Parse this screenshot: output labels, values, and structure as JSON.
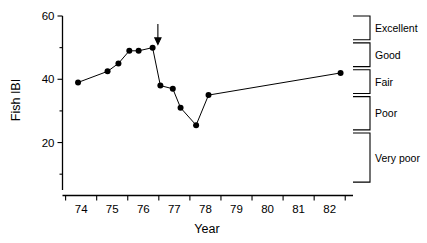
{
  "chart_data": {
    "type": "line",
    "title": "",
    "xlabel": "Year",
    "ylabel": "Fish IBI",
    "xlim": [
      73.4,
      82.75
    ],
    "ylim": [
      5,
      60
    ],
    "grid": false,
    "legend_position": "right",
    "x_major_ticks": [
      73.5,
      74.5,
      75.5,
      76.5,
      77.5,
      78.5,
      79.5,
      80.5,
      81.5,
      82.5
    ],
    "x_tick_labels": [
      "74",
      "75",
      "76",
      "77",
      "78",
      "79",
      "80",
      "81",
      "82"
    ],
    "x_label_positions": [
      74,
      75,
      76,
      77,
      78,
      79,
      80,
      81,
      82
    ],
    "y_major_ticks": [
      20,
      40,
      60
    ],
    "y_tick_labels": [
      "20",
      "40",
      "60"
    ],
    "y_minor_ticks": [
      10,
      30,
      50
    ],
    "series": [
      {
        "name": "Fish IBI",
        "marker": "filled-circle",
        "x": [
          73.9,
          74.85,
          75.2,
          75.55,
          75.85,
          76.3,
          76.55,
          76.95,
          77.2,
          77.7,
          78.1,
          82.35
        ],
        "values": [
          39.0,
          42.5,
          45.0,
          49.0,
          49.0,
          50.0,
          38.0,
          37.0,
          31.0,
          25.5,
          35.0,
          42.0
        ]
      }
    ],
    "annotations": [
      {
        "type": "arrow",
        "direction": "down",
        "x": 76.47,
        "y_top": 57.5,
        "y_bottom": 51.5,
        "label": ""
      }
    ],
    "legend": {
      "style": "range-brackets",
      "entries": [
        {
          "label": "Excellent",
          "y_top": 60.0,
          "y_bottom": 52.5
        },
        {
          "label": "Good",
          "y_top": 51.5,
          "y_bottom": 44.0
        },
        {
          "label": "Fair",
          "y_top": 43.0,
          "y_bottom": 35.5
        },
        {
          "label": "Poor",
          "y_top": 34.5,
          "y_bottom": 24.0
        },
        {
          "label": "Very poor",
          "y_top": 23.0,
          "y_bottom": 7.5
        }
      ]
    },
    "colors": {
      "line": "#000000",
      "marker": "#000000",
      "axis": "#000000",
      "background": "#ffffff"
    }
  }
}
